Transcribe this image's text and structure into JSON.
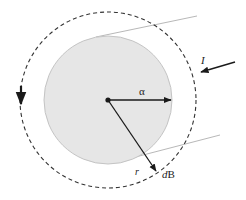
{
  "diagram": {
    "labels": {
      "alpha": "α",
      "radius": "r",
      "field_element": "dB",
      "field_element_prefix": "d",
      "field_element_symbol": "B",
      "current": "I"
    },
    "colors": {
      "background": "#ffffff",
      "wire_fill": "#e6e6e6",
      "wire_stroke": "#c4c4c4",
      "tangent_lines": "#b8b8b8",
      "dashed_circle": "#333333",
      "arrows": "#1a1a1a"
    },
    "elements": {
      "wire_cross_section": "filled circle of radius alpha",
      "amperian_loop": "dashed circle of radius r",
      "current_arrow": "arrow labeled I pointing toward wire",
      "circulation_arrow": "downward arrow on left of dashed loop"
    }
  }
}
